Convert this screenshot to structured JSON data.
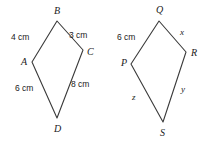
{
  "figure": {
    "stroke_color": "#3a3a3a",
    "text_color": "#1b1b1b",
    "background_color": "#ffffff",
    "shapes": [
      {
        "name": "quadrilateral-abcd",
        "vertices": [
          {
            "label": "B",
            "x": 57,
            "y": 21,
            "label_x": 54,
            "label_y": 6
          },
          {
            "label": "C",
            "x": 83,
            "y": 50,
            "label_x": 87,
            "label_y": 47
          },
          {
            "label": "D",
            "x": 57,
            "y": 118,
            "label_x": 54,
            "label_y": 124
          },
          {
            "label": "A",
            "x": 32,
            "y": 62,
            "label_x": 21,
            "label_y": 57
          }
        ],
        "side_labels": [
          {
            "name": "side-ab-length",
            "text": "4 cm",
            "x": 11,
            "y": 33
          },
          {
            "name": "side-bc-length",
            "text": "3 cm",
            "x": 69,
            "y": 31
          },
          {
            "name": "side-ad-length",
            "text": "6 cm",
            "x": 15,
            "y": 84
          },
          {
            "name": "side-cd-length",
            "text": "8 cm",
            "x": 71,
            "y": 80
          }
        ]
      },
      {
        "name": "quadrilateral-pqrs",
        "vertices": [
          {
            "label": "Q",
            "x": 159,
            "y": 21,
            "label_x": 156,
            "label_y": 5
          },
          {
            "label": "R",
            "x": 186,
            "y": 52,
            "label_x": 191,
            "label_y": 48
          },
          {
            "label": "S",
            "x": 163,
            "y": 122,
            "label_x": 160,
            "label_y": 128
          },
          {
            "label": "P",
            "x": 131,
            "y": 64,
            "label_x": 121,
            "label_y": 58
          }
        ],
        "side_labels": [
          {
            "name": "side-pq-length",
            "text": "6 cm",
            "x": 117,
            "y": 33
          },
          {
            "name": "side-qr-length",
            "text": "x",
            "x": 180,
            "y": 28
          },
          {
            "name": "side-ps-length",
            "text": "z",
            "x": 132,
            "y": 93
          },
          {
            "name": "side-rs-length",
            "text": "y",
            "x": 181,
            "y": 85
          }
        ]
      }
    ]
  }
}
